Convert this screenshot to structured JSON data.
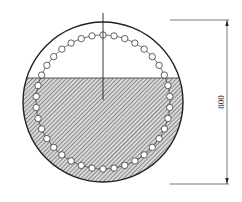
{
  "diagram": {
    "type": "circular-cross-section",
    "dimension_label": "800",
    "outer_circle": {
      "cx": 103,
      "cy": 102,
      "r": 80
    },
    "bead_ring": {
      "cx": 103,
      "cy": 102,
      "r": 67,
      "count": 38,
      "bead_radius": 3.2
    },
    "fill_level_y": 78,
    "center_line": {
      "x": 103,
      "y1": 13,
      "y2": 100
    },
    "dimension": {
      "x": 227,
      "y_top": 20,
      "y_bottom": 184,
      "ext_x1": 170,
      "ext_x2": 229
    },
    "colors": {
      "stroke": "#222222",
      "hatch": "#666666",
      "hatch_bg": "#d9d9d9",
      "bead_fill": "#ffffff"
    }
  }
}
